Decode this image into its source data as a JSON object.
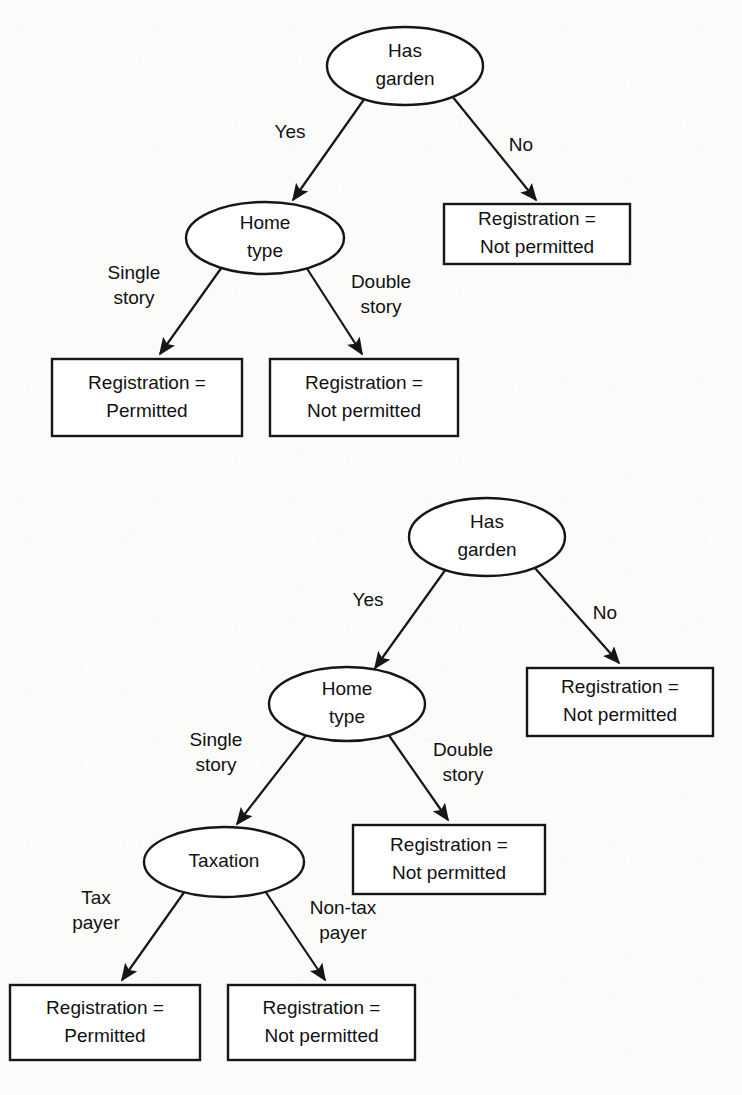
{
  "diagram": {
    "type": "decision-tree",
    "background_color": "#fbfbfa",
    "stroke_color": "#161616",
    "text_color": "#111111",
    "trees": [
      {
        "id": "tree-1",
        "name": "Decision tree without taxation split",
        "nodes": [
          {
            "id": "t1-root",
            "kind": "decision",
            "lines": [
              "Has",
              "garden"
            ],
            "cx": 405,
            "cy": 66,
            "rx": 78,
            "ry": 39
          },
          {
            "id": "t1-no-box",
            "kind": "outcome",
            "lines": [
              "Registration =",
              "Not permitted"
            ],
            "x": 444,
            "y": 204,
            "w": 186,
            "h": 60
          },
          {
            "id": "t1-home",
            "kind": "decision",
            "lines": [
              "Home",
              "type"
            ],
            "cx": 265,
            "cy": 238,
            "rx": 79,
            "ry": 36
          },
          {
            "id": "t1-permit",
            "kind": "outcome",
            "lines": [
              "Registration =",
              "Permitted"
            ],
            "x": 52,
            "y": 359,
            "w": 190,
            "h": 77
          },
          {
            "id": "t1-nopermit",
            "kind": "outcome",
            "lines": [
              "Registration =",
              "Not permitted"
            ],
            "x": 270,
            "y": 359,
            "w": 188,
            "h": 77
          }
        ],
        "edges": [
          {
            "id": "t1-e1",
            "from": "t1-root",
            "to": "t1-home",
            "label_lines": [
              "Yes"
            ],
            "x1": 365,
            "y1": 98,
            "x2": 293,
            "y2": 200,
            "lx": 290,
            "ly": 133
          },
          {
            "id": "t1-e2",
            "from": "t1-root",
            "to": "t1-no-box",
            "label_lines": [
              "No"
            ],
            "x1": 452,
            "y1": 96,
            "x2": 536,
            "y2": 200,
            "lx": 521,
            "ly": 146
          },
          {
            "id": "t1-e3",
            "from": "t1-home",
            "to": "t1-permit",
            "label_lines": [
              "Single",
              "story"
            ],
            "x1": 222,
            "y1": 267,
            "x2": 160,
            "y2": 354,
            "lx": 134,
            "ly": 286
          },
          {
            "id": "t1-e4",
            "from": "t1-home",
            "to": "t1-nopermit",
            "label_lines": [
              "Double",
              "story"
            ],
            "x1": 306,
            "y1": 267,
            "x2": 362,
            "y2": 354,
            "lx": 381,
            "ly": 295
          }
        ]
      },
      {
        "id": "tree-2",
        "name": "Decision tree with taxation split",
        "nodes": [
          {
            "id": "t2-root",
            "kind": "decision",
            "lines": [
              "Has",
              "garden"
            ],
            "cx": 487,
            "cy": 537,
            "rx": 78,
            "ry": 39
          },
          {
            "id": "t2-no-box",
            "kind": "outcome",
            "lines": [
              "Registration =",
              "Not permitted"
            ],
            "x": 527,
            "y": 668,
            "w": 186,
            "h": 68
          },
          {
            "id": "t2-home",
            "kind": "decision",
            "lines": [
              "Home",
              "type"
            ],
            "cx": 347,
            "cy": 704,
            "rx": 78,
            "ry": 37
          },
          {
            "id": "t2-double",
            "kind": "outcome",
            "lines": [
              "Registration =",
              "Not permitted"
            ],
            "x": 353,
            "y": 825,
            "w": 192,
            "h": 69
          },
          {
            "id": "t2-tax",
            "kind": "decision",
            "lines": [
              "Taxation"
            ],
            "cx": 224,
            "cy": 862,
            "rx": 80,
            "ry": 35
          },
          {
            "id": "t2-permit",
            "kind": "outcome",
            "lines": [
              "Registration =",
              "Permitted"
            ],
            "x": 10,
            "y": 985,
            "w": 190,
            "h": 75
          },
          {
            "id": "t2-nopermit",
            "kind": "outcome",
            "lines": [
              "Registration =",
              "Not permitted"
            ],
            "x": 228,
            "y": 985,
            "w": 187,
            "h": 75
          }
        ],
        "edges": [
          {
            "id": "t2-e1",
            "from": "t2-root",
            "to": "t2-home",
            "label_lines": [
              "Yes"
            ],
            "x1": 446,
            "y1": 569,
            "x2": 375,
            "y2": 668,
            "lx": 368,
            "ly": 601
          },
          {
            "id": "t2-e2",
            "from": "t2-root",
            "to": "t2-no-box",
            "label_lines": [
              "No"
            ],
            "x1": 534,
            "y1": 567,
            "x2": 619,
            "y2": 663,
            "lx": 605,
            "ly": 614
          },
          {
            "id": "t2-e3",
            "from": "t2-home",
            "to": "t2-tax",
            "label_lines": [
              "Single",
              "story"
            ],
            "x1": 307,
            "y1": 734,
            "x2": 237,
            "y2": 824,
            "lx": 216,
            "ly": 753
          },
          {
            "id": "t2-e4",
            "from": "t2-home",
            "to": "t2-double",
            "label_lines": [
              "Double",
              "story"
            ],
            "x1": 388,
            "y1": 734,
            "x2": 448,
            "y2": 820,
            "lx": 463,
            "ly": 763
          },
          {
            "id": "t2-e5",
            "from": "t2-tax",
            "to": "t2-permit",
            "label_lines": [
              "Tax",
              "payer"
            ],
            "x1": 185,
            "y1": 891,
            "x2": 122,
            "y2": 980,
            "lx": 96,
            "ly": 911
          },
          {
            "id": "t2-e6",
            "from": "t2-tax",
            "to": "t2-nopermit",
            "label_lines": [
              "Non-tax",
              "payer"
            ],
            "x1": 265,
            "y1": 891,
            "x2": 325,
            "y2": 980,
            "lx": 343,
            "ly": 921
          }
        ]
      }
    ]
  }
}
